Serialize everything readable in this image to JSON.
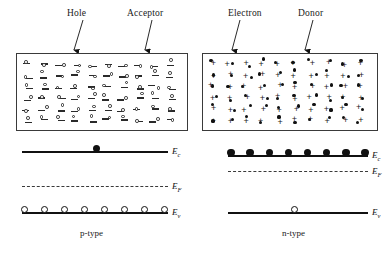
{
  "figure": {
    "panels": [
      {
        "id": "p-type",
        "type_label": "p-type",
        "annotations": [
          {
            "name": "hole",
            "text": "Hole"
          },
          {
            "name": "acceptor",
            "text": "Acceptor"
          }
        ],
        "crystal": {
          "dopant_symbol": "minus-sign",
          "dopant_meaning": "Acceptor",
          "carrier_symbol": "open-circle",
          "carrier_meaning": "Hole",
          "dopant_count": 60,
          "carrier_count": 55
        },
        "band_diagram": {
          "levels": [
            {
              "name": "Ec",
              "symbol": "E",
              "subscript": "c",
              "style": "solid",
              "carriers": "electron",
              "carrier_count": 1
            },
            {
              "name": "EF",
              "symbol": "E",
              "subscript": "F",
              "style": "dashed",
              "carriers": "none",
              "carrier_count": 0
            },
            {
              "name": "Ev",
              "symbol": "E",
              "subscript": "v",
              "style": "solid",
              "carriers": "hole",
              "carrier_count": 8
            }
          ]
        }
      },
      {
        "id": "n-type",
        "type_label": "n-type",
        "annotations": [
          {
            "name": "electron",
            "text": "Electron"
          },
          {
            "name": "donor",
            "text": "Donor"
          }
        ],
        "crystal": {
          "dopant_symbol": "plus-sign",
          "dopant_meaning": "Donor",
          "carrier_symbol": "filled-circle",
          "carrier_meaning": "Electron",
          "dopant_count": 60,
          "carrier_count": 55
        },
        "band_diagram": {
          "levels": [
            {
              "name": "Ec",
              "symbol": "E",
              "subscript": "c",
              "style": "solid",
              "carriers": "electron",
              "carrier_count": 8
            },
            {
              "name": "EF",
              "symbol": "E",
              "subscript": "F",
              "style": "dashed",
              "carriers": "none",
              "carrier_count": 0
            },
            {
              "name": "Ev",
              "symbol": "E",
              "subscript": "v",
              "style": "solid",
              "carriers": "hole",
              "carrier_count": 1
            }
          ]
        }
      }
    ],
    "colors": {
      "ink": "#1a1a1a",
      "line": "#111111",
      "dash": "#3a3a3a",
      "background": "#ffffff"
    }
  },
  "labels": {
    "hole": "Hole",
    "acceptor": "Acceptor",
    "electron": "Electron",
    "donor": "Donor",
    "p_type": "p-type",
    "n_type": "n-type",
    "E": "E",
    "sub_c": "c",
    "sub_F": "F",
    "sub_v": "v"
  }
}
